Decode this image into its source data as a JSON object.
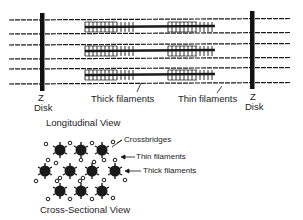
{
  "diagram": {
    "longitudinal": {
      "z_disk_left": [
        "Z",
        "Disk"
      ],
      "z_disk_right": [
        "Z",
        "Disk"
      ],
      "thick_label": "Thick filaments",
      "thin_label": "Thin filaments",
      "title": "Longitudinal View"
    },
    "cross_section": {
      "crossbridges_label": "Crossbridges",
      "thin_label": "Thin filaments",
      "thick_label": "Thick filaments",
      "title": "Cross-Sectional View"
    },
    "colors": {
      "ink": "#1a1a1a",
      "background": "#ffffff"
    }
  }
}
